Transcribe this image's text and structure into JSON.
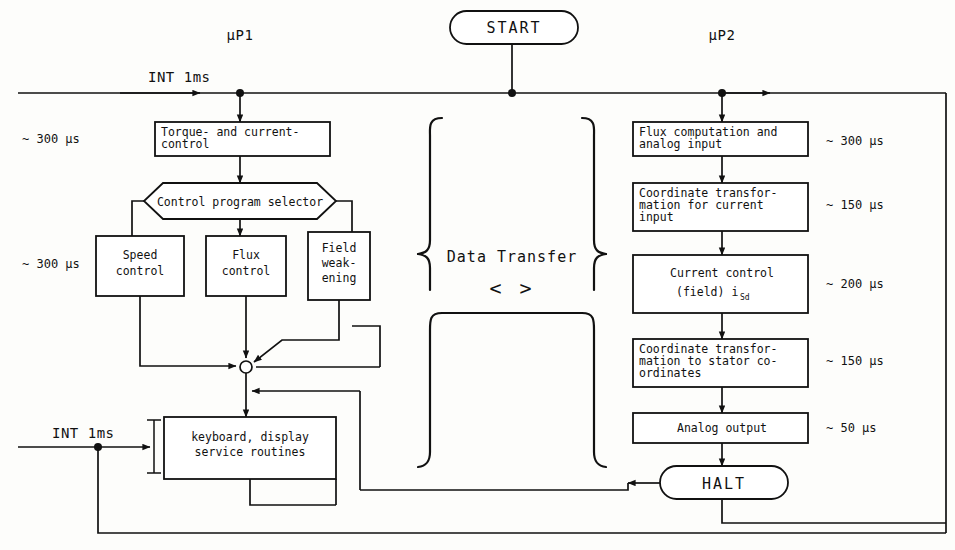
{
  "diagram": {
    "colors": {
      "line": "#111111",
      "background": "#fdfdfb",
      "box_fill": "#ffffff"
    },
    "headers": {
      "left_processor": "µP1",
      "right_processor": "µP2"
    },
    "terminators": {
      "start": "START",
      "halt": "HALT"
    },
    "interrupts": {
      "top": "INT 1ms",
      "bottom": "INT 1ms"
    },
    "center": {
      "label": "Data Transfer",
      "arrow_symbol": "< >"
    },
    "left_timings": [
      {
        "text": "~ 300 µs"
      },
      {
        "text": "~ 300 µs"
      }
    ],
    "right_timings": [
      {
        "text": "~ 300 µs"
      },
      {
        "text": "~ 150 µs"
      },
      {
        "text": "~ 200 µs"
      },
      {
        "text": "~ 150 µs"
      },
      {
        "text": "~  50 µs"
      }
    ],
    "left_blocks": {
      "torque": {
        "line1": "Torque- and current-",
        "line2": "control"
      },
      "selector": {
        "line1": "Control program selector"
      },
      "speed": {
        "line1": "Speed",
        "line2": "control"
      },
      "flux": {
        "line1": "Flux",
        "line2": "control"
      },
      "field": {
        "line1": "Field",
        "line2": "weak-",
        "line3": "ening"
      },
      "keyboard": {
        "line1": "keyboard, display",
        "line2": "service routines"
      }
    },
    "right_blocks": {
      "flux_comp": {
        "line1": "Flux computation and",
        "line2": "analog input"
      },
      "coord_in": {
        "line1": "Coordinate transfor-",
        "line2": "mation for current",
        "line3": "input"
      },
      "current_ctrl": {
        "line1": "Current control",
        "line2_pre": "(field) i",
        "line2_sub": "Sd"
      },
      "coord_out": {
        "line1": "Coordinate transfor-",
        "line2": "mation to stator co-",
        "line3": "ordinates"
      },
      "analog_out": {
        "line1": "Analog output"
      }
    }
  }
}
